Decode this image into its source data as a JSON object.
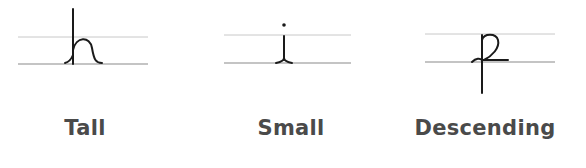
{
  "colors": {
    "guide_top": "#c8c8c8",
    "guide_base": "#8a8a8a",
    "stroke": "#1a1a1a",
    "label": "#4a4a4a"
  },
  "panels": [
    {
      "letter": "h",
      "label": "Tall"
    },
    {
      "letter": "i",
      "label": "Small"
    },
    {
      "letter": "p",
      "label": "Descending"
    }
  ]
}
